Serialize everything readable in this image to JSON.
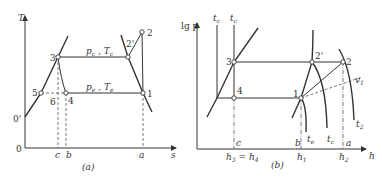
{
  "diagram_a": {
    "caption": "(a)",
    "y_axis_label": "T",
    "x_axis_label": "s",
    "origin_label": "0",
    "origin_prime_label": "0'",
    "points": {
      "p1": "1",
      "p2": "2",
      "p2p": "2'",
      "p3": "3",
      "p4": "4",
      "p5": "5",
      "p6": "6"
    },
    "isobar_high": {
      "p": "p",
      "p_sub": "c",
      "sep": " , ",
      "t": "T",
      "t_sub": "c"
    },
    "isobar_low": {
      "p": "p",
      "p_sub": "e",
      "sep": " , ",
      "t": "T",
      "t_sub": "e"
    },
    "x_ticks": {
      "c": "c",
      "b": "b",
      "a": "a"
    }
  },
  "diagram_b": {
    "caption": "(b)",
    "y_axis_label": "lg p",
    "x_axis_label": "h",
    "points": {
      "p1": "1",
      "p2": "2",
      "p2p": "2'",
      "p3": "3",
      "p4": "4"
    },
    "top_labels": {
      "t1": "t",
      "t1_sub": "c",
      "t2": "t",
      "t2_sub": "c"
    },
    "curve_labels": {
      "v1": "v",
      "v1_sub": "1",
      "t2": "t",
      "t2_sub": "2",
      "te1": "t",
      "te1_sub": "e",
      "te2": "t",
      "te2_sub": "c"
    },
    "x_ticks": {
      "c": "c",
      "b": "b",
      "a": "a"
    },
    "h_labels": {
      "h34": "h",
      "h34_sub1": "3",
      "h34_eq": " = h",
      "h34_sub2": "4",
      "h1": "h",
      "h1_sub": "1",
      "h2": "h",
      "h2_sub": "2"
    }
  }
}
